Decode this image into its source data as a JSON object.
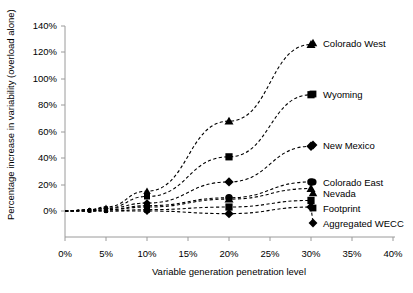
{
  "chart_data": {
    "type": "line",
    "title": "",
    "xlabel": "Variable generation penetration level",
    "ylabel": "Percentage increase in variability (overload alone)",
    "xlim": [
      0,
      40
    ],
    "ylim": [
      0,
      140
    ],
    "xticks": [
      "0%",
      "5%",
      "10%",
      "15%",
      "20%",
      "25%",
      "30%",
      "35%",
      "40%"
    ],
    "yticks": [
      "0%",
      "20%",
      "40%",
      "60%",
      "80%",
      "100%",
      "120%",
      "140%"
    ],
    "xtick_values": [
      0,
      5,
      10,
      15,
      20,
      25,
      30,
      35,
      40
    ],
    "ytick_values": [
      0,
      20,
      40,
      60,
      80,
      100,
      120,
      140
    ],
    "grid": false,
    "legend_position": "right-inline-labels",
    "line_style": "dashed",
    "x": [
      0,
      3,
      5,
      10,
      20,
      30
    ],
    "series": [
      {
        "name": "Colorado West",
        "marker": "triangle",
        "values": [
          0,
          1,
          3,
          15,
          68,
          126
        ]
      },
      {
        "name": "Wyoming",
        "marker": "square",
        "values": [
          0,
          1,
          2,
          11,
          41,
          88
        ]
      },
      {
        "name": "New Mexico",
        "marker": "diamond",
        "values": [
          0,
          1,
          2,
          6,
          22,
          49
        ]
      },
      {
        "name": "Colorado East",
        "marker": "circle",
        "values": [
          0,
          0,
          1,
          4,
          10,
          22
        ]
      },
      {
        "name": "Nevada",
        "marker": "triangle",
        "values": [
          0,
          0,
          1,
          3,
          9,
          17
        ]
      },
      {
        "name": "Footprint",
        "marker": "square",
        "values": [
          0,
          0,
          0,
          1,
          3,
          8
        ]
      },
      {
        "name": "Aggregated WECC",
        "marker": "diamond",
        "values": [
          0,
          0,
          0,
          0,
          -2,
          3
        ]
      }
    ]
  },
  "labels": {
    "colorado_west": "Colorado West",
    "wyoming": "Wyoming",
    "new_mexico": "New Mexico",
    "colorado_east": "Colorado East",
    "nevada": "Nevada",
    "footprint": "Footprint",
    "aggregated_wecc": "Aggregated WECC",
    "xaxis": "Variable generation penetration level",
    "yaxis": "Percentage increase in variability (overload alone)",
    "y140": "140%",
    "y120": "120%",
    "y100": "100%",
    "y80": "80%",
    "y60": "60%",
    "y40": "40%",
    "y20": "20%",
    "y0": "0%",
    "x0": "0%",
    "x5": "5%",
    "x10": "10%",
    "x15": "15%",
    "x20": "20%",
    "x25": "25%",
    "x30": "30%",
    "x35": "35%",
    "x40": "40%"
  },
  "colors": {
    "ink": "#000000",
    "axis": "#9a9a9a",
    "background": "#ffffff"
  }
}
